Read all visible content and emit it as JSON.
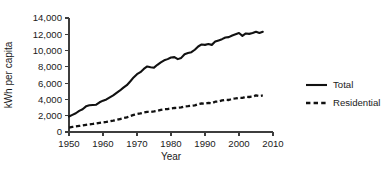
{
  "chart_data": {
    "type": "line",
    "title": "",
    "xlabel": "Year",
    "ylabel": "kWh per capita",
    "xlim": [
      1950,
      2010
    ],
    "ylim": [
      0,
      14000
    ],
    "grid": false,
    "legend_position": "right",
    "xticks": [
      1950,
      1960,
      1970,
      1980,
      1990,
      2000,
      2010
    ],
    "xtick_labels": [
      "1950",
      "1960",
      "1970",
      "1980",
      "1990",
      "2000",
      "2010"
    ],
    "yticks": [
      0,
      2000,
      4000,
      6000,
      8000,
      10000,
      12000,
      14000
    ],
    "ytick_labels": [
      "0",
      "2,000",
      "4,000",
      "6,000",
      "8,000",
      "10,000",
      "12,000",
      "14,000"
    ],
    "x": [
      1950,
      1951,
      1952,
      1953,
      1954,
      1955,
      1956,
      1957,
      1958,
      1959,
      1960,
      1961,
      1962,
      1963,
      1964,
      1965,
      1966,
      1967,
      1968,
      1969,
      1970,
      1971,
      1972,
      1973,
      1974,
      1975,
      1976,
      1977,
      1978,
      1979,
      1980,
      1981,
      1982,
      1983,
      1984,
      1985,
      1986,
      1987,
      1988,
      1989,
      1990,
      1991,
      1992,
      1993,
      1994,
      1995,
      1996,
      1997,
      1998,
      1999,
      2000,
      2001,
      2002,
      2003,
      2004,
      2005,
      2006,
      2007
    ],
    "series": [
      {
        "name": "Total",
        "style": "solid",
        "values": [
          1900,
          2100,
          2300,
          2600,
          2800,
          3150,
          3280,
          3320,
          3350,
          3650,
          3850,
          4000,
          4250,
          4500,
          4800,
          5100,
          5450,
          5750,
          6200,
          6700,
          7100,
          7350,
          7750,
          8050,
          7950,
          7900,
          8250,
          8550,
          8800,
          8950,
          9150,
          9200,
          8950,
          9100,
          9550,
          9700,
          9800,
          10100,
          10500,
          10750,
          10700,
          10800,
          10700,
          11100,
          11250,
          11400,
          11600,
          11650,
          11850,
          12000,
          12150,
          11800,
          12100,
          12050,
          12150,
          12300,
          12150,
          12300
        ]
      },
      {
        "name": "Residential",
        "style": "dashed",
        "values": [
          550,
          620,
          680,
          740,
          800,
          880,
          940,
          990,
          1050,
          1120,
          1180,
          1240,
          1320,
          1400,
          1490,
          1590,
          1700,
          1800,
          1950,
          2100,
          2200,
          2280,
          2400,
          2480,
          2450,
          2520,
          2600,
          2720,
          2800,
          2820,
          2900,
          2950,
          2980,
          3020,
          3150,
          3180,
          3220,
          3280,
          3420,
          3500,
          3480,
          3580,
          3530,
          3720,
          3750,
          3880,
          3950,
          3930,
          4080,
          4120,
          4200,
          4180,
          4330,
          4300,
          4350,
          4500,
          4420,
          4490
        ]
      }
    ],
    "legend": [
      {
        "label": "Total",
        "style": "solid"
      },
      {
        "label": "Residential",
        "style": "dashed"
      }
    ],
    "geometry": {
      "plot_left": 69,
      "plot_right": 273,
      "plot_top": 18,
      "plot_bottom": 132,
      "legend_x": 306,
      "legend_y_total": 85,
      "legend_y_residential": 103,
      "legend_swatch_x1": 306,
      "legend_swatch_x2": 327,
      "legend_text_x": 333,
      "xlabel_x": 171,
      "xlabel_y": 160,
      "ylabel_x": 12,
      "ylabel_y": 75
    },
    "colors": {
      "line": "#111111",
      "axis": "#3d3d3d",
      "text": "#1a1a1a",
      "background": "#ffffff"
    }
  }
}
